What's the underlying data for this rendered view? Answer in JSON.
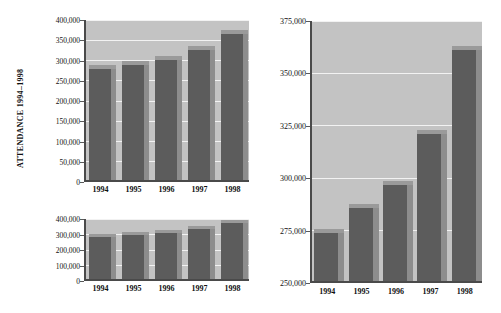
{
  "figure": {
    "axis_title": "ATTENDANCE 1994–1998",
    "bar_color": "#575757",
    "bar_side_color": "#8d8d8d",
    "plot_background": "#c3c3c3",
    "gridline_color": "#f2f2f2",
    "axis_color": "#4a4a4a"
  },
  "chart_data": [
    {
      "id": "top-left",
      "type": "bar",
      "title": "",
      "xlabel": "",
      "ylabel": "ATTENDANCE 1994–1998",
      "categories": [
        "1994",
        "1995",
        "1996",
        "1997",
        "1998"
      ],
      "values": [
        273000,
        285000,
        296000,
        320000,
        360000
      ],
      "ylim": [
        0,
        400000
      ],
      "yticks": [
        0,
        50000,
        100000,
        150000,
        200000,
        250000,
        300000,
        350000,
        400000
      ],
      "ytick_labels": [
        "0",
        "50,000",
        "100,000",
        "150,000",
        "200,000",
        "250,000",
        "300,000",
        "350,000",
        "400,000"
      ],
      "grid": true,
      "legend": "none"
    },
    {
      "id": "bottom-left",
      "type": "bar",
      "title": "",
      "xlabel": "",
      "ylabel": "",
      "categories": [
        "1994",
        "1995",
        "1996",
        "1997",
        "1998"
      ],
      "values": [
        273000,
        285000,
        296000,
        320000,
        360000
      ],
      "ylim": [
        0,
        400000
      ],
      "yticks": [
        0,
        100000,
        200000,
        300000,
        400000
      ],
      "ytick_labels": [
        "0",
        "100,000",
        "200,000",
        "300,000",
        "400,000"
      ],
      "grid": true,
      "legend": "none"
    },
    {
      "id": "right",
      "type": "bar",
      "title": "",
      "xlabel": "",
      "ylabel": "",
      "categories": [
        "1994",
        "1995",
        "1996",
        "1997",
        "1998"
      ],
      "values": [
        273000,
        285000,
        296000,
        320000,
        360000
      ],
      "ylim": [
        250000,
        375000
      ],
      "yticks": [
        250000,
        275000,
        300000,
        325000,
        350000,
        375000
      ],
      "ytick_labels": [
        "250,000",
        "275,000",
        "300,000",
        "325,000",
        "350,000",
        "375,000"
      ],
      "grid": true,
      "legend": "none"
    }
  ]
}
